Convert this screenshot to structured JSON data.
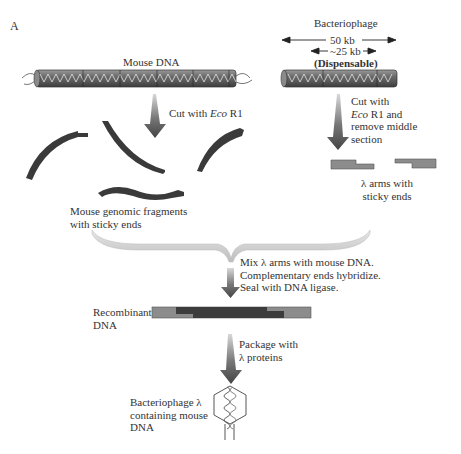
{
  "panel_label": "A",
  "mouse": {
    "title": "Mouse DNA",
    "step1": {
      "prefix": "Cut with ",
      "enzyme": "Eco",
      "suffix": " R1"
    },
    "fragments_label": [
      "Mouse genomic fragments",
      "with sticky ends"
    ]
  },
  "phage": {
    "title": "Bacteriophage",
    "full_length": "50 kb",
    "dispensable_length": "~25 kb",
    "dispensable_label": "(Dispensable)",
    "step1_line1": "Cut with",
    "step1_line2": {
      "enzyme": "Eco",
      "suffix": " R1 and"
    },
    "step1_line3": "remove middle",
    "step1_line4": "section",
    "arms_label": [
      "λ arms with",
      "sticky ends"
    ]
  },
  "merge": {
    "instructions": [
      "Mix λ arms with mouse DNA.",
      "Complementary ends hybridize.",
      "Seal with DNA ligase."
    ]
  },
  "recombinant": {
    "label": [
      "Recombinant",
      "DNA"
    ]
  },
  "package": {
    "instructions": [
      "Package with",
      "λ proteins"
    ]
  },
  "final": {
    "label": [
      "Bacteriophage λ",
      "containing mouse",
      "DNA"
    ]
  },
  "colors": {
    "dna_dark": "#3a3a3a",
    "dna_mid": "#8a8a8a",
    "lambda_arm": "#8c8c8c",
    "insert": "#3c3c3c",
    "arrow": "#555555",
    "bracket": "#cfcfcf"
  }
}
